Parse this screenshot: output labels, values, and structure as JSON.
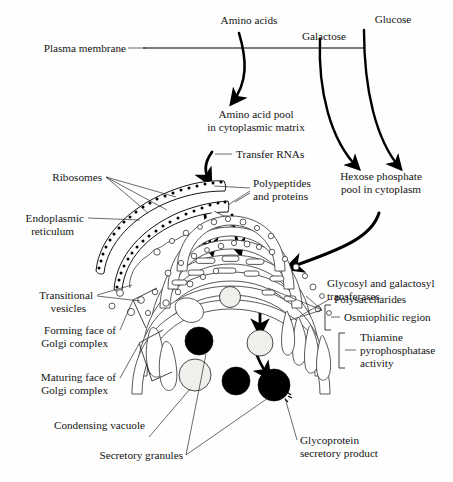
{
  "figure": {
    "background_color": "#fefefe",
    "ink_color": "#141414",
    "membrane_color": "#7d7d7d"
  },
  "labels": {
    "plasma_membrane": "Plasma membrane",
    "amino_acids": "Amino acids",
    "galactose": "Galactose",
    "glucose": "Glucose",
    "amino_acid_pool_line1": "Amino acid pool",
    "amino_acid_pool_line2": "in cytoplasmic matrix",
    "transfer_rnas": "Transfer RNAs",
    "hexose_line1": "Hexose phosphate",
    "hexose_line2": "pool in cytoplasm",
    "ribosomes": "Ribosomes",
    "polypeptides_line1": "Polypeptides",
    "polypeptides_line2": "and proteins",
    "endoplasmic_line1": "Endoplasmic",
    "endoplasmic_line2": "reticulum",
    "transitional_line1": "Transitional",
    "transitional_line2": "vesicles",
    "forming_face_line1": "Forming face of",
    "forming_face_line2": "Golgi complex",
    "maturing_face_line1": "Maturing face of",
    "maturing_face_line2": "Golgi complex",
    "condensing_vacuole": "Condensing vacuole",
    "secretory_granules": "Secretory granules",
    "glycoprotein_line1": "Glycoprotein",
    "glycoprotein_line2": "secretory product",
    "glycosyl_line1": "Glycosyl and galactosyl",
    "glycosyl_line2": "transferases",
    "polysaccharides": "Polysaccharides",
    "osmiophilic": "Osmiophilic region",
    "thiamine_line1": "Thiamine",
    "thiamine_line2": "pyrophosphatase",
    "thiamine_line3": "activity"
  },
  "structures": {
    "plasma_membrane_y": 48,
    "golgi_cisterna_count": 7,
    "er_cisterna_count": 2,
    "secretory_granule_count": 3,
    "condensing_vacuole_count": 3,
    "transitional_vesicle_count": 34
  }
}
